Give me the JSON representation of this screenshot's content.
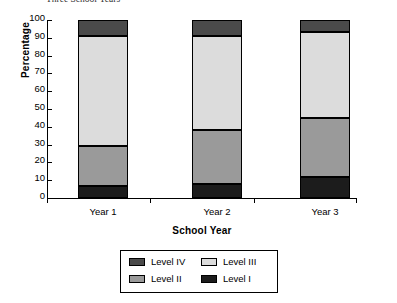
{
  "caption": "Three School Years",
  "chart_data": {
    "type": "bar",
    "stacked": true,
    "stack_mode": "percent",
    "title": "",
    "subtitle": "",
    "xlabel": "School Year",
    "ylabel": "Percentage",
    "categories": [
      "Year 1",
      "Year 2",
      "Year 3"
    ],
    "ylim": [
      0,
      100
    ],
    "yticks": [
      0,
      10,
      20,
      30,
      40,
      50,
      60,
      70,
      80,
      90,
      100
    ],
    "ytick_labels": [
      "0",
      "10",
      "20",
      "30",
      "40",
      "50",
      "60",
      "70",
      "80",
      "90",
      "100"
    ],
    "grid": false,
    "legend_position": "bottom",
    "legend_order": [
      "Level IV",
      "Level III",
      "Level II",
      "Level I"
    ],
    "series": [
      {
        "name": "Level I",
        "color": "#1c1c1c",
        "values": [
          7,
          8,
          12
        ]
      },
      {
        "name": "Level II",
        "color": "#9a9a9a",
        "values": [
          22,
          30,
          33
        ]
      },
      {
        "name": "Level III",
        "color": "#dcdcdc",
        "values": [
          62,
          53,
          48
        ]
      },
      {
        "name": "Level IV",
        "color": "#4a4a4a",
        "values": [
          9,
          9,
          7
        ]
      }
    ],
    "segment_tops": {
      "Year 1": {
        "Level I": 7,
        "Level II": 29,
        "Level III": 91,
        "Level IV": 100
      },
      "Year 2": {
        "Level I": 8,
        "Level II": 38,
        "Level III": 91,
        "Level IV": 100
      },
      "Year 3": {
        "Level I": 12,
        "Level II": 45,
        "Level III": 93,
        "Level IV": 100
      }
    }
  },
  "legend": {
    "entries": [
      {
        "label": "Level IV",
        "color": "#4a4a4a"
      },
      {
        "label": "Level III",
        "color": "#dcdcdc"
      },
      {
        "label": "Level II",
        "color": "#9a9a9a"
      },
      {
        "label": "Level I",
        "color": "#1c1c1c"
      }
    ]
  }
}
